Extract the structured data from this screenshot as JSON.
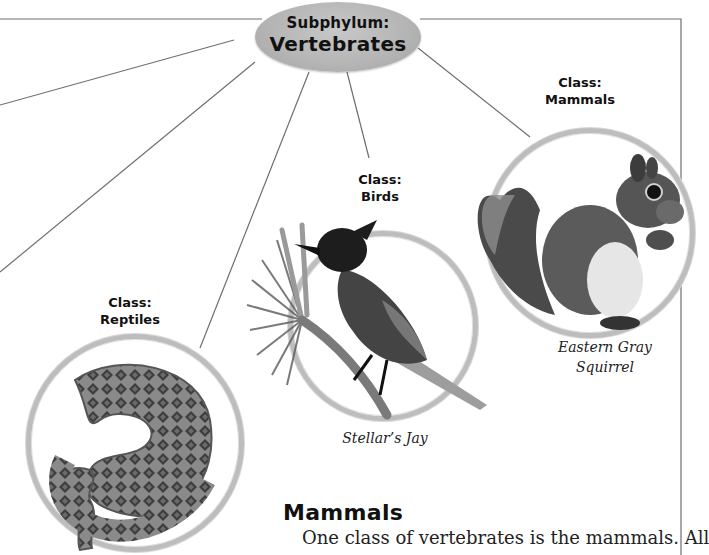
{
  "diagram": {
    "root": {
      "line1": "Subphylum:",
      "line2": "Vertebrates"
    },
    "classes": [
      {
        "label_line1": "Class:",
        "label_line2": "Reptiles",
        "image": "rattlesnake-photo",
        "caption": ""
      },
      {
        "label_line1": "Class:",
        "label_line2": "Birds",
        "image": "stellers-jay-photo",
        "caption": "Stellar’s Jay"
      },
      {
        "label_line1": "Class:",
        "label_line2": "Mammals",
        "image": "gray-squirrel-photo",
        "caption_line1": "Eastern Gray",
        "caption_line2": "Squirrel"
      }
    ]
  },
  "section": {
    "heading": "Mammals",
    "body": "One class of vertebrates is the mammals. All"
  },
  "colors": {
    "ellipse_fill": "#b4b4b4",
    "ring": "#bdbdbd",
    "connector": "#6e6e6e",
    "text": "#111111"
  }
}
